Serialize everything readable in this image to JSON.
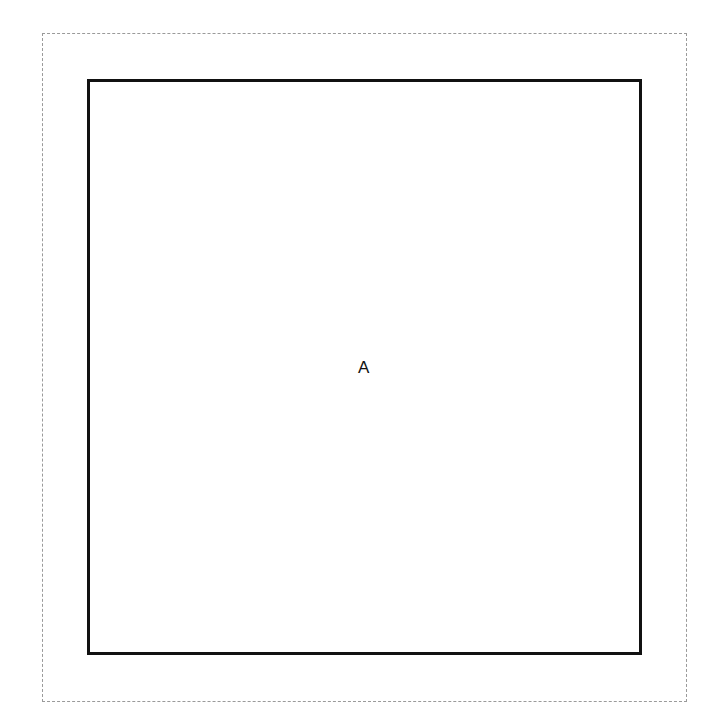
{
  "diagram": {
    "outer_frame": {
      "style": "dashed",
      "color": "#9a9a9a"
    },
    "box": {
      "label": "A",
      "border_color": "#111111"
    }
  }
}
